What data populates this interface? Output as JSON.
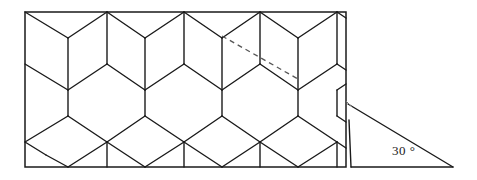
{
  "figure": {
    "background_color": "#ffffff",
    "stroke_color": "#1a1a1a",
    "canvas": {
      "width": 477,
      "height": 180
    }
  },
  "frame": {
    "name": "rectangular-boundary",
    "x": 25,
    "y": 12,
    "width": 321,
    "height": 155,
    "stroke_width": 1.4
  },
  "lattice": {
    "type": "hexagonal-honeycomb",
    "orientation": "pointy-top",
    "columns": 5,
    "rows": 3,
    "cell_width": 77,
    "cell_height": 104,
    "apex_height": 26,
    "side_height": 52,
    "column_x": [
      30,
      68,
      107,
      145,
      184,
      222,
      260,
      298,
      337,
      346
    ],
    "row_y": [
      12,
      38,
      64,
      90,
      116,
      142,
      167
    ],
    "stroke_width": 1.4
  },
  "dashed_line": {
    "name": "diagonal-dashed-line",
    "x1": 222,
    "y1": 36,
    "x2": 298,
    "y2": 79,
    "dash_pattern": "5,4",
    "stroke_width": 1.2,
    "color": "#555555"
  },
  "triangle": {
    "name": "inclination-triangle",
    "apex_left_x": 348,
    "apex_left_y": 104,
    "base_left_x": 351,
    "base_left_y": 167,
    "base_right_x": 453,
    "base_right_y": 167,
    "stroke_width": 1.4
  },
  "labels": {
    "angle": "30 °",
    "angle_x": 395,
    "angle_y": 150
  }
}
